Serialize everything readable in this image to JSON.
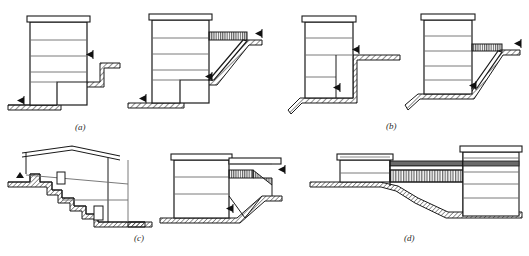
{
  "figure": {
    "type": "architectural-section-diagram",
    "panel_count": 4,
    "captions": [
      {
        "id": "a",
        "label": "(a)"
      },
      {
        "id": "b",
        "label": "(b)"
      },
      {
        "id": "c",
        "label": "(c)"
      },
      {
        "id": "d",
        "label": "(d)"
      }
    ],
    "colors": {
      "line": "#1a1a1a",
      "thin_line": "#6b6b6b",
      "ground_hatch": "#2b2b2b",
      "background": "#ffffff",
      "marker": "#111111",
      "deck_hatch": "#3a3a3a"
    },
    "panels": {
      "a": {
        "caption": "(a)",
        "figures": [
          {
            "name": "stepped-podium-section-left",
            "description": "multi-storey block on stepped ground, lower ground level at left",
            "storeys": 4,
            "roof_slab": true,
            "ground_markers": 2,
            "ramp": false
          },
          {
            "name": "stepped-podium-section-right",
            "description": "multi-storey block with inclined bridge deck to upper ground level",
            "storeys": 4,
            "roof_slab": true,
            "ground_markers": 2,
            "ramp": true
          }
        ]
      },
      "b": {
        "caption": "(b)",
        "figures": [
          {
            "name": "cut-into-slope-section-left",
            "description": "block cut into slope with basement storeys below upper ground level",
            "storeys": 4,
            "roof_slab": true,
            "ground_markers": 2,
            "ramp": false
          },
          {
            "name": "cut-into-slope-section-right",
            "description": "block with horizontal deck bridging to upper slope level",
            "storeys": 4,
            "roof_slab": true,
            "ground_markers": 2,
            "ramp": true
          }
        ]
      },
      "c": {
        "caption": "(c)",
        "figures": [
          {
            "name": "pitched-roof-house-on-slope",
            "description": "house with pitched roof stepping down a hillside, two openings in the slope face",
            "storeys": 2,
            "roof_slab": false,
            "pitched_roof": true,
            "openings": 2,
            "ground_markers": 1,
            "ramp": false
          },
          {
            "name": "block-with-deck-over-excavation",
            "description": "block with flat roof and deck bridging over excavated ground to slope",
            "storeys": 3,
            "roof_slab": true,
            "ground_markers": 2,
            "ramp": true
          }
        ]
      },
      "d": {
        "caption": "(d)",
        "figures": [
          {
            "name": "linked-blocks-across-valley",
            "description": "two blocks of differing height linked by a hatched bridge structure spanning falling ground",
            "blocks": 2,
            "bridge": true,
            "storeys_left": 2,
            "storeys_right": 4,
            "ground_markers": 0
          }
        ]
      }
    }
  }
}
